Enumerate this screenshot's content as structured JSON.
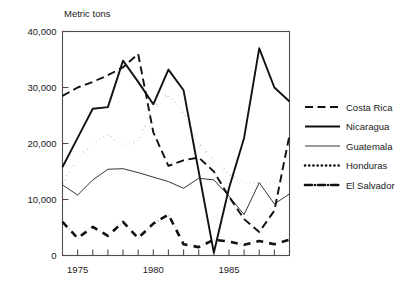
{
  "chart_data": {
    "type": "line",
    "title": "",
    "ylabel": "Metric tons",
    "xlabel": "",
    "ylim": [
      0,
      40000
    ],
    "xlim": [
      1974,
      1989
    ],
    "grid": false,
    "legend_position": "right",
    "ytick_labels": [
      "0",
      "10,000",
      "20,000",
      "30,000",
      "40,000"
    ],
    "ytick_values": [
      0,
      10000,
      20000,
      30000,
      40000
    ],
    "xtick_labels": [
      "1975",
      "1980",
      "1985"
    ],
    "xtick_values": [
      1975,
      1980,
      1985
    ],
    "x": [
      1974,
      1975,
      1976,
      1977,
      1978,
      1979,
      1980,
      1981,
      1982,
      1983,
      1984,
      1985,
      1986,
      1987,
      1988,
      1989
    ],
    "series": [
      {
        "name": "Costa Rica",
        "style": "dashed",
        "values": [
          28500,
          30000,
          31000,
          32200,
          33600,
          36000,
          22000,
          16000,
          17000,
          17500,
          15000,
          10500,
          6500,
          4200,
          8000,
          21500
        ]
      },
      {
        "name": "Nicaragua",
        "style": "solid-thick",
        "values": [
          15800,
          21000,
          26200,
          26500,
          34800,
          31000,
          27000,
          33200,
          29500,
          15000,
          500,
          12000,
          21000,
          37000,
          30000,
          27500
        ]
      },
      {
        "name": "Guatemala",
        "style": "solid-thin",
        "values": [
          12600,
          10800,
          13500,
          15400,
          15500,
          14800,
          14000,
          13200,
          12000,
          13800,
          13500,
          10600,
          7300,
          13000,
          9200,
          11000
        ]
      },
      {
        "name": "Honduras",
        "style": "dotted",
        "values": [
          12900,
          17200,
          20100,
          21500,
          19700,
          20500,
          26500,
          28700,
          25500,
          20000,
          17000,
          14500,
          13000,
          13000,
          13000,
          13000
        ]
      },
      {
        "name": "El Salvador",
        "style": "dash-dot",
        "values": [
          6000,
          3100,
          5100,
          3500,
          6000,
          3100,
          5700,
          7300,
          2000,
          1500,
          2800,
          2500,
          1900,
          2600,
          2000,
          2800
        ]
      }
    ]
  },
  "axis": {
    "y_title": "Metric tons"
  },
  "legend": {
    "entries": [
      {
        "label": "Costa Rica",
        "style": "dashed"
      },
      {
        "label": "Nicaragua",
        "style": "solid-thick"
      },
      {
        "label": "Guatemala",
        "style": "solid-thin"
      },
      {
        "label": "Honduras",
        "style": "dotted"
      },
      {
        "label": "El Salvador",
        "style": "dash-dot"
      }
    ]
  },
  "colors": {
    "line": "#111111",
    "frame": "#4d4d4d",
    "text": "#1a1a1a",
    "background": "#ffffff"
  }
}
